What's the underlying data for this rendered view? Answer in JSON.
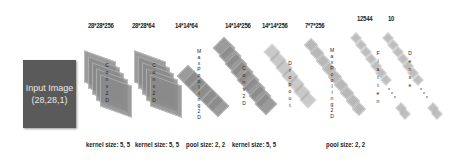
{
  "input": {
    "line1": "Input Image",
    "line2": "(28,28,1)"
  },
  "layers": [
    {
      "type": "Conv2D",
      "shape": "28*28*256",
      "param": "kernel size: 5, 5"
    },
    {
      "type": "Conv2D",
      "shape": "28*28*64",
      "param": "kernel size: 5, 5"
    },
    {
      "type": "MaxPooling2D",
      "shape": "14*14*64",
      "param": "pool size: 2, 2"
    },
    {
      "type": "Conv2D",
      "shape": "14*14*256",
      "param": "kernel size: 5, 5"
    },
    {
      "type": "Dropout",
      "shape": "14*14*256",
      "param": ""
    },
    {
      "type": "MaxPooling2D",
      "shape": "7*7*256",
      "param": "pool size: 2, 2"
    },
    {
      "type": "Flatten",
      "shape": "12544",
      "param": ""
    },
    {
      "type": "Dense",
      "shape": "10",
      "param": ""
    }
  ],
  "colors": {
    "input_box": "#5a5a5a",
    "layer_fill": "#8a8a8a",
    "text": "#222222"
  }
}
